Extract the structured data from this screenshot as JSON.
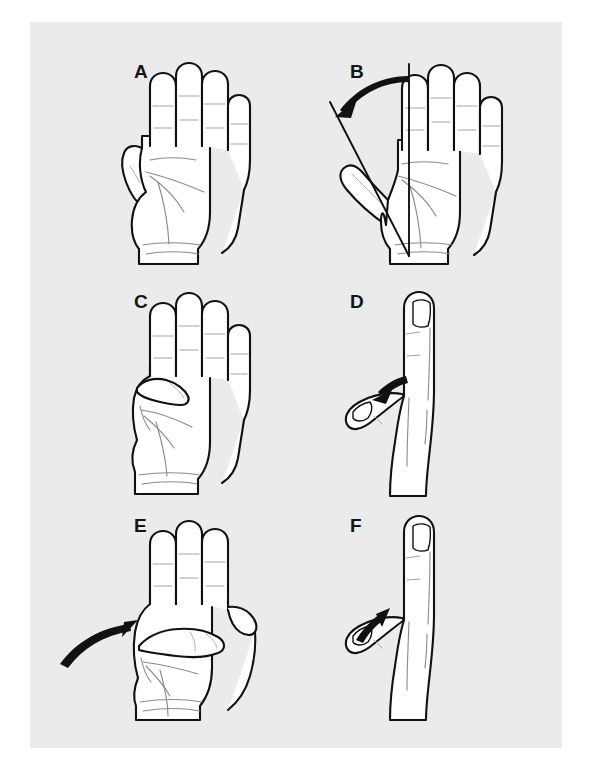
{
  "figure": {
    "background_color": "#ffffff",
    "plate_color": "#ebebeb",
    "ink_color": "#111111",
    "crease_color": "#8a8a8a",
    "panel_count": 6,
    "grid": "2 columns x 3 rows",
    "style": "black and white line drawing"
  },
  "panels": [
    {
      "id": "A",
      "label": "A",
      "view": "palmar",
      "position": "row 1, column 1",
      "description": "Open palm, fingers extended together, thumb resting adducted alongside the index finger",
      "has_arrow": false,
      "has_angle_lines": false
    },
    {
      "id": "B",
      "label": "B",
      "view": "palmar",
      "position": "row 1, column 2",
      "description": "Radial abduction of the thumb with goniometer reference lines and a curved arc arrow measuring the angle between the index finger axis and the thumb axis",
      "has_arrow": true,
      "arrow_style": "curved arc",
      "arrow_direction": "clockwise from vertical axis toward thumb axis",
      "has_angle_lines": true,
      "angle_lines": [
        "vertical index/forearm axis line",
        "diagonal thumb axis line"
      ]
    },
    {
      "id": "C",
      "label": "C",
      "view": "palmar",
      "position": "row 2, column 1",
      "description": "Thumb adducted and flexed across the palm toward the base of the fingers",
      "has_arrow": false,
      "has_angle_lines": false
    },
    {
      "id": "D",
      "label": "D",
      "view": "lateral",
      "position": "row 2, column 2",
      "description": "Side view with thumb palmarly abducted; curved arrow points down and left toward the thumb indicating adduction back to the hand",
      "has_arrow": true,
      "arrow_style": "curved tapered",
      "arrow_direction": "down-left toward thumb",
      "has_angle_lines": false
    },
    {
      "id": "E",
      "label": "E",
      "view": "palmar",
      "position": "row 3, column 1",
      "description": "Thumb opposition sweeping across the palm; curved arrow from the lower left sweeps up and right toward the index finger base",
      "has_arrow": true,
      "arrow_style": "curved tapered",
      "arrow_direction": "up-right across palm",
      "has_angle_lines": false
    },
    {
      "id": "F",
      "label": "F",
      "view": "lateral",
      "position": "row 3, column 2",
      "description": "Side view with thumb palmarly abducted; curved arrow points up and right away from the thumb indicating palmar abduction",
      "has_arrow": true,
      "arrow_style": "curved tapered",
      "arrow_direction": "up-right away from thumb",
      "has_angle_lines": false
    }
  ]
}
